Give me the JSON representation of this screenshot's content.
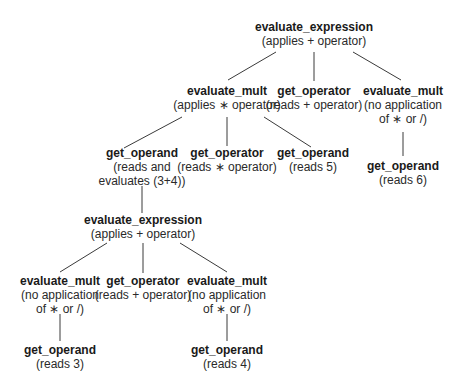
{
  "diagram": {
    "type": "parse-tree",
    "nodes": [
      {
        "id": "n0",
        "title": "evaluate_expression",
        "desc": [
          "(applies + operator)"
        ]
      },
      {
        "id": "n1",
        "title": "evaluate_mult",
        "desc": [
          "(applies ∗ operator)"
        ]
      },
      {
        "id": "n2",
        "title": "get_operator",
        "desc": [
          "(reads + operator)"
        ]
      },
      {
        "id": "n3",
        "title": "evaluate_mult",
        "desc": [
          "(no application",
          "of ∗ or /)"
        ]
      },
      {
        "id": "n4",
        "title": "get_operand",
        "desc": [
          "(reads and",
          "evaluates (3+4))"
        ]
      },
      {
        "id": "n5",
        "title": "get_operator",
        "desc": [
          "(reads ∗ operator)"
        ]
      },
      {
        "id": "n6",
        "title": "get_operand",
        "desc": [
          "(reads 5)"
        ]
      },
      {
        "id": "n7",
        "title": "get_operand",
        "desc": [
          "(reads 6)"
        ]
      },
      {
        "id": "n8",
        "title": "evaluate_expression",
        "desc": [
          "(applies + operator)"
        ]
      },
      {
        "id": "n9",
        "title": "evaluate_mult",
        "desc": [
          "(no application",
          "of ∗ or /)"
        ]
      },
      {
        "id": "n10",
        "title": "get_operator",
        "desc": [
          "(reads + operator)"
        ]
      },
      {
        "id": "n11",
        "title": "evaluate_mult",
        "desc": [
          "(no application",
          "of ∗ or /)"
        ]
      },
      {
        "id": "n12",
        "title": "get_operand",
        "desc": [
          "(reads 3)"
        ]
      },
      {
        "id": "n13",
        "title": "get_operand",
        "desc": [
          "(reads 4)"
        ]
      }
    ],
    "edges": [
      [
        "n0",
        "n1"
      ],
      [
        "n0",
        "n2"
      ],
      [
        "n0",
        "n3"
      ],
      [
        "n1",
        "n4"
      ],
      [
        "n1",
        "n5"
      ],
      [
        "n1",
        "n6"
      ],
      [
        "n3",
        "n7"
      ],
      [
        "n4",
        "n8"
      ],
      [
        "n8",
        "n9"
      ],
      [
        "n8",
        "n10"
      ],
      [
        "n8",
        "n11"
      ],
      [
        "n9",
        "n12"
      ],
      [
        "n11",
        "n13"
      ]
    ],
    "line_color": "#3a3a3a"
  }
}
